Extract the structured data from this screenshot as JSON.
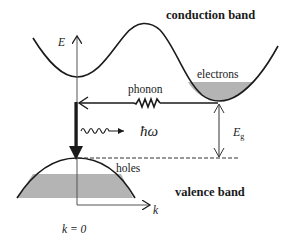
{
  "diagram": {
    "labels": {
      "conduction_band": "conduction band",
      "valence_band": "valence band",
      "electrons": "electrons",
      "holes": "holes",
      "phonon": "phonon",
      "photon": "ħω",
      "energy_axis": "E",
      "k_axis": "k",
      "k_origin": "k = 0",
      "bandgap": "E",
      "bandgap_sub": "g"
    },
    "colors": {
      "line": "#1a1a1a",
      "fill": "#b4b4b4",
      "background": "#ffffff"
    }
  }
}
